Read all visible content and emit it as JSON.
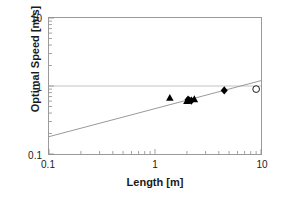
{
  "chart_data": {
    "type": "scatter",
    "title": "",
    "xlabel": "Length [m]",
    "ylabel": "Optimal Speed [m/s]",
    "xscale": "log",
    "yscale": "log",
    "xlim": [
      0.1,
      10
    ],
    "ylim": [
      0.1,
      10
    ],
    "xticks": [
      0.1,
      1,
      10
    ],
    "xtick_labels": [
      "0.1",
      "1",
      "10"
    ],
    "yticks": [
      0.1,
      1,
      10
    ],
    "ytick_labels": [
      "0.1",
      "1",
      "10"
    ],
    "grid": "horizontal-major-only",
    "legend": "none",
    "series": [
      {
        "name": "triangles",
        "marker": "filled-triangle",
        "color": "#000000",
        "points": [
          {
            "x": 1.38,
            "y": 0.67
          },
          {
            "x": 2.0,
            "y": 0.6
          },
          {
            "x": 2.1,
            "y": 0.62
          },
          {
            "x": 2.35,
            "y": 0.64
          }
        ]
      },
      {
        "name": "diamonds",
        "marker": "filled-diamond",
        "color": "#000000",
        "points": [
          {
            "x": 2.05,
            "y": 0.63
          },
          {
            "x": 2.2,
            "y": 0.61
          },
          {
            "x": 4.5,
            "y": 0.86
          }
        ]
      },
      {
        "name": "open-circle",
        "marker": "open-circle",
        "color": "#000000",
        "points": [
          {
            "x": 9.0,
            "y": 0.9
          }
        ]
      }
    ],
    "trendline": {
      "name": "power-law-fit",
      "color": "#8c8c8c",
      "from": {
        "x": 0.1,
        "y": 0.18
      },
      "to": {
        "x": 10.0,
        "y": 1.2
      }
    }
  }
}
